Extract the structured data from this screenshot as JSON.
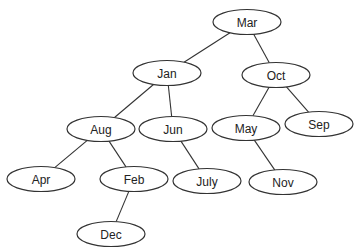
{
  "diagram": {
    "type": "binary-tree",
    "nodes": [
      {
        "id": "mar",
        "label": "Mar",
        "cx": 247,
        "cy": 22
      },
      {
        "id": "jan",
        "label": "Jan",
        "cx": 167,
        "cy": 73
      },
      {
        "id": "oct",
        "label": "Oct",
        "cx": 276,
        "cy": 75
      },
      {
        "id": "aug",
        "label": "Aug",
        "cx": 101,
        "cy": 129
      },
      {
        "id": "jun",
        "label": "Jun",
        "cx": 173,
        "cy": 129
      },
      {
        "id": "may",
        "label": "May",
        "cx": 246,
        "cy": 128
      },
      {
        "id": "sep",
        "label": "Sep",
        "cx": 319,
        "cy": 124
      },
      {
        "id": "apr",
        "label": "Apr",
        "cx": 41,
        "cy": 179
      },
      {
        "id": "feb",
        "label": "Feb",
        "cx": 134,
        "cy": 179
      },
      {
        "id": "july",
        "label": "July",
        "cx": 207,
        "cy": 181
      },
      {
        "id": "nov",
        "label": "Nov",
        "cx": 283,
        "cy": 182
      },
      {
        "id": "dec",
        "label": "Dec",
        "cx": 111,
        "cy": 234
      }
    ],
    "edges": [
      {
        "from": "mar",
        "to": "jan"
      },
      {
        "from": "mar",
        "to": "oct"
      },
      {
        "from": "jan",
        "to": "aug"
      },
      {
        "from": "jan",
        "to": "jun"
      },
      {
        "from": "oct",
        "to": "may"
      },
      {
        "from": "oct",
        "to": "sep"
      },
      {
        "from": "aug",
        "to": "apr"
      },
      {
        "from": "aug",
        "to": "feb"
      },
      {
        "from": "jun",
        "to": "july"
      },
      {
        "from": "may",
        "to": "nov"
      },
      {
        "from": "feb",
        "to": "dec"
      }
    ],
    "node_rx": 34,
    "node_ry": 12.5,
    "stroke_color": "#333333",
    "fill_color": "#ffffff"
  }
}
